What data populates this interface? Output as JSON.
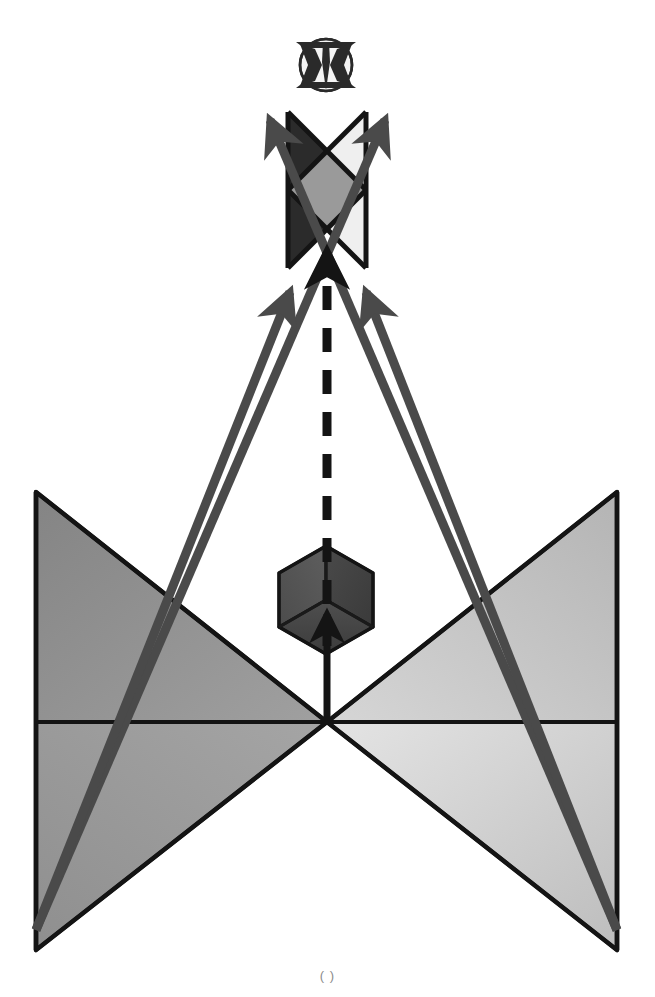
{
  "figure": {
    "title": "",
    "background_color": "#ffffff",
    "width": 655,
    "height": 997,
    "bottom_caption": "( )"
  },
  "palette": {
    "stroke": "#111111",
    "arrow_gray": "#4a4a4a",
    "dark_fill": "#2b2b2b",
    "mid_gray": "#9a9a9a",
    "light_gray": "#e2e2e2",
    "cube_top_left": "#555555",
    "cube_top_right": "#3f3f3f",
    "cube_front": "#4a4a4a",
    "cone_left_near": "#8c8c8c",
    "cone_left_far": "#9b9b9b",
    "cone_right_near": "#cfcfcf",
    "cone_right_far": "#bdbdbd",
    "emblem_dark": "#2a2a2a",
    "emblem_light": "#f2f2f2"
  },
  "emblem": {
    "name": "circular-winged-emblem",
    "label": "",
    "center_x": 326,
    "center_y": 65,
    "radius": 27
  },
  "upper_block": {
    "name": "upper-rectangular-region",
    "label": "",
    "left": 288,
    "right": 366,
    "top": 112,
    "bottom": 268,
    "regions": [
      {
        "name": "dark-left-region",
        "shade": "#2b2b2b"
      },
      {
        "name": "center-diamond",
        "shade": "#9a9a9a"
      },
      {
        "name": "light-right-region",
        "shade": "#e8e8e8"
      }
    ]
  },
  "cube": {
    "name": "isometric-cube",
    "label": "",
    "center_x": 326,
    "center_y": 600,
    "half_width": 47,
    "half_height": 54
  },
  "cones": {
    "name": "light-cone-bowtie",
    "apex_x": 327,
    "apex_y": 722,
    "left_x": 36,
    "right_x": 617,
    "top_y": 492,
    "bottom_y": 950
  },
  "arrows": [
    {
      "name": "dashed-vertical-arrow",
      "style": "dashed",
      "label": "",
      "from": [
        327,
        640
      ],
      "to": [
        327,
        248
      ]
    },
    {
      "name": "solid-vertical-arrow",
      "style": "solid",
      "label": "",
      "from": [
        327,
        718
      ],
      "to": [
        327,
        612
      ]
    },
    {
      "name": "inner-left-diagonal-arrow",
      "style": "solid",
      "label": "",
      "from": [
        36,
        930
      ],
      "to": [
        277,
        288
      ]
    },
    {
      "name": "inner-right-diagonal-arrow",
      "style": "solid",
      "label": "",
      "from": [
        617,
        930
      ],
      "to": [
        378,
        288
      ]
    },
    {
      "name": "outer-left-diagonal-arrow",
      "style": "solid",
      "label": "",
      "from": [
        36,
        930
      ],
      "to": [
        270,
        116
      ]
    },
    {
      "name": "outer-right-diagonal-arrow",
      "style": "solid",
      "label": "",
      "from": [
        617,
        930
      ],
      "to": [
        385,
        116
      ]
    }
  ],
  "labels": {
    "top": "",
    "center": "",
    "bottom": ""
  }
}
